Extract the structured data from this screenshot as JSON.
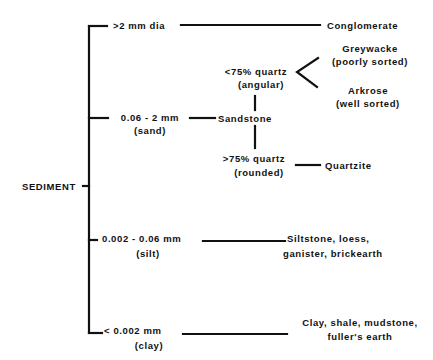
{
  "diagram": {
    "root": "SEDIMENT",
    "colors": {
      "ink": "#111111",
      "background": "#ffffff"
    },
    "branches": [
      {
        "size": ">2 mm dia",
        "class": "",
        "result": "Conglomerate"
      },
      {
        "size": "0.06 - 2 mm",
        "class": "(sand)",
        "result": "Sandstone",
        "sub": {
          "low_quartz": {
            "line1": "<75% quartz",
            "line2": "(angular)"
          },
          "high_quartz": {
            "line1": ">75% quartz",
            "line2": "(rounded)"
          },
          "greywacke": {
            "line1": "Greywacke",
            "line2": "(poorly sorted)"
          },
          "arkrose": {
            "line1": "Arkrose",
            "line2": "(well sorted)"
          },
          "quartzite": "Quartzite"
        }
      },
      {
        "size": "0.002 - 0.06 mm",
        "class": "(silt)",
        "result_line1": "Siltstone, loess,",
        "result_line2": "ganister, brickearth"
      },
      {
        "size": "< 0.002 mm",
        "class": "(clay)",
        "result_line1": "Clay, shale, mudstone,",
        "result_line2": "fuller's earth"
      }
    ]
  }
}
